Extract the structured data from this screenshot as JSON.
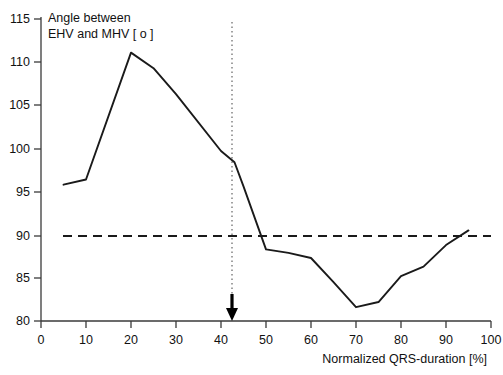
{
  "chart_data": {
    "type": "line",
    "title_line1": "Angle between",
    "title_line2": "EHV and MHV [ o ]",
    "xlabel": "Normalized QRS-duration [%]",
    "ylabel": "Angle between EHV and MHV [ o ]",
    "xlim": [
      0,
      100
    ],
    "ylim": [
      80,
      115
    ],
    "xticks": [
      0,
      10,
      20,
      30,
      40,
      50,
      60,
      70,
      80,
      90,
      100
    ],
    "xtick_labels": [
      "0",
      "10",
      "20",
      "30",
      "40",
      "50",
      "60",
      "70",
      "80",
      "90",
      "100"
    ],
    "yticks": [
      80,
      85,
      90,
      95,
      100,
      105,
      110,
      115
    ],
    "ytick_labels": [
      "80",
      "85",
      "90",
      "95",
      "100",
      "105",
      "110",
      "115"
    ],
    "grid": false,
    "legend": null,
    "series": [
      {
        "name": "Angle between EHV and MHV",
        "style": "solid",
        "color": "#1a1a1a",
        "x": [
          5,
          10,
          20,
          25,
          30,
          40,
          43,
          45,
          50,
          55,
          60,
          65,
          70,
          75,
          80,
          85,
          90,
          95
        ],
        "values": [
          95.8,
          96.4,
          111.1,
          109.3,
          106.3,
          99.7,
          98.4,
          95.6,
          88.3,
          87.9,
          87.3,
          84.5,
          81.6,
          82.2,
          85.2,
          86.3,
          88.8,
          90.5
        ]
      }
    ],
    "reference_lines": [
      {
        "name": "ninety-degree-reference",
        "orientation": "horizontal",
        "value": 90,
        "style": "dashed",
        "color": "#1a1a1a"
      },
      {
        "name": "crossover-marker",
        "orientation": "vertical",
        "value": 42.5,
        "style": "dotted",
        "color": "#6a6a6a"
      }
    ],
    "annotations": [
      {
        "name": "arrow-marker",
        "type": "arrow-down",
        "x": 42.5,
        "y": 80,
        "label": ""
      }
    ]
  }
}
